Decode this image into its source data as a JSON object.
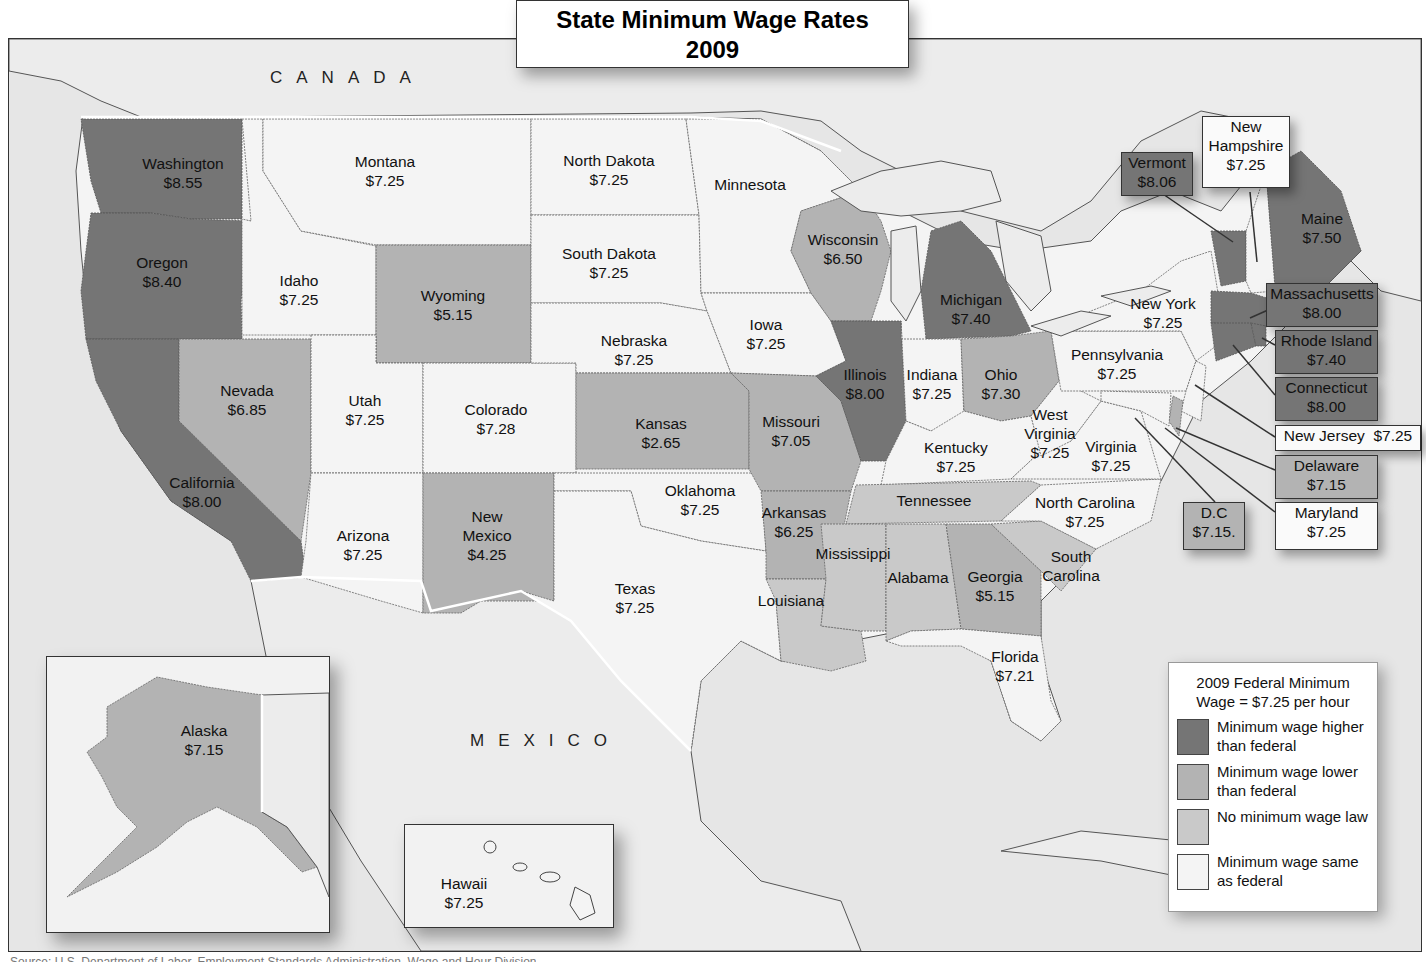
{
  "title": {
    "line1": "State Minimum Wage Rates",
    "line2": "2009"
  },
  "countries": {
    "canada": "CANADA",
    "mexico": "MEXICO"
  },
  "legend": {
    "title": "2009 Federal Minimum Wage = $7.25  per hour",
    "items": [
      {
        "category": "higher",
        "label": "Minimum wage higher than federal",
        "color": "#757575"
      },
      {
        "category": "lower",
        "label": "Minimum wage lower than federal",
        "color": "#b3b3b3"
      },
      {
        "category": "none",
        "label": "No minimum wage law",
        "color": "#c9c9c9"
      },
      {
        "category": "same",
        "label": "Minimum wage same as federal",
        "color": "#f4f4f4"
      }
    ]
  },
  "federal_minimum_wage": "$7.25",
  "states": {
    "washington": {
      "name": "Washington",
      "wage": "$8.55",
      "category": "higher"
    },
    "oregon": {
      "name": "Oregon",
      "wage": "$8.40",
      "category": "higher"
    },
    "california": {
      "name": "California",
      "wage": "$8.00",
      "category": "higher"
    },
    "nevada": {
      "name": "Nevada",
      "wage": "$6.85",
      "category": "lower"
    },
    "idaho": {
      "name": "Idaho",
      "wage": "$7.25",
      "category": "same"
    },
    "montana": {
      "name": "Montana",
      "wage": "$7.25",
      "category": "same"
    },
    "wyoming": {
      "name": "Wyoming",
      "wage": "$5.15",
      "category": "lower"
    },
    "utah": {
      "name": "Utah",
      "wage": "$7.25",
      "category": "same"
    },
    "colorado": {
      "name": "Colorado",
      "wage": "$7.28",
      "category": "same"
    },
    "arizona": {
      "name": "Arizona",
      "wage": "$7.25",
      "category": "same"
    },
    "new_mexico": {
      "name": "New Mexico",
      "name_l1": "New",
      "name_l2": "Mexico",
      "wage": "$4.25",
      "category": "lower"
    },
    "north_dakota": {
      "name": "North Dakota",
      "wage": "$7.25",
      "category": "same"
    },
    "south_dakota": {
      "name": "South Dakota",
      "wage": "$7.25",
      "category": "same"
    },
    "nebraska": {
      "name": "Nebraska",
      "wage": "$7.25",
      "category": "same"
    },
    "kansas": {
      "name": "Kansas",
      "wage": "$2.65",
      "category": "lower"
    },
    "oklahoma": {
      "name": "Oklahoma",
      "wage": "$7.25",
      "category": "same"
    },
    "texas": {
      "name": "Texas",
      "wage": "$7.25",
      "category": "same"
    },
    "minnesota": {
      "name": "Minnesota",
      "wage": "",
      "category": "same"
    },
    "iowa": {
      "name": "Iowa",
      "wage": "$7.25",
      "category": "same"
    },
    "missouri": {
      "name": "Missouri",
      "wage": "$7.05",
      "category": "lower"
    },
    "arkansas": {
      "name": "Arkansas",
      "wage": "$6.25",
      "category": "lower"
    },
    "louisiana": {
      "name": "Louisiana",
      "wage": "",
      "category": "none"
    },
    "wisconsin": {
      "name": "Wisconsin",
      "wage": "$6.50",
      "category": "lower"
    },
    "illinois": {
      "name": "Illinois",
      "wage": "$8.00",
      "category": "higher"
    },
    "michigan": {
      "name": "Michigan",
      "wage": "$7.40",
      "category": "higher"
    },
    "indiana": {
      "name": "Indiana",
      "wage": "$7.25",
      "category": "same"
    },
    "ohio": {
      "name": "Ohio",
      "wage": "$7.30",
      "category": "lower"
    },
    "kentucky": {
      "name": "Kentucky",
      "wage": "$7.25",
      "category": "same"
    },
    "tennessee": {
      "name": "Tennessee",
      "wage": "",
      "category": "none"
    },
    "mississippi": {
      "name": "Mississippi",
      "wage": "",
      "category": "none"
    },
    "alabama": {
      "name": "Alabama",
      "wage": "",
      "category": "none"
    },
    "georgia": {
      "name": "Georgia",
      "wage": "$5.15",
      "category": "lower"
    },
    "florida": {
      "name": "Florida",
      "wage": "$7.21",
      "category": "same"
    },
    "south_carolina": {
      "name": "South Carolina",
      "name_l1": "South",
      "name_l2": "Carolina",
      "wage": "",
      "category": "none"
    },
    "north_carolina": {
      "name": "North Carolina",
      "wage": "$7.25",
      "category": "same"
    },
    "virginia": {
      "name": "Virginia",
      "wage": "$7.25",
      "category": "same"
    },
    "west_virginia": {
      "name": "West Virginia",
      "name_l1": "West",
      "name_l2": "Virginia",
      "wage": "$7.25",
      "category": "same"
    },
    "pennsylvania": {
      "name": "Pennsylvania",
      "wage": "$7.25",
      "category": "same"
    },
    "new_york": {
      "name": "New York",
      "wage": "$7.25",
      "category": "same"
    },
    "vermont": {
      "name": "Vermont",
      "wage": "$8.06",
      "category": "higher"
    },
    "new_hampshire": {
      "name": "New Hampshire",
      "name_l1": "New",
      "name_l2": "Hampshire",
      "wage": "$7.25",
      "category": "same"
    },
    "maine": {
      "name": "Maine",
      "wage": "$7.50",
      "category": "higher"
    },
    "massachusetts": {
      "name": "Massachusetts",
      "wage": "$8.00",
      "category": "higher"
    },
    "rhode_island": {
      "name": "Rhode Island",
      "wage": "$7.40",
      "category": "higher"
    },
    "connecticut": {
      "name": "Connecticut",
      "wage": "$8.00",
      "category": "higher"
    },
    "new_jersey": {
      "name": "New Jersey",
      "wage": "$7.25",
      "category": "same"
    },
    "delaware": {
      "name": "Delaware",
      "wage": "$7.15",
      "category": "lower"
    },
    "maryland": {
      "name": "Maryland",
      "wage": "$7.25",
      "category": "same"
    },
    "dc": {
      "name": "D.C",
      "wage": "$7.15.",
      "category": "lower"
    },
    "alaska": {
      "name": "Alaska",
      "wage": "$7.15",
      "category": "lower"
    },
    "hawaii": {
      "name": "Hawaii",
      "wage": "$7.25",
      "category": "same"
    }
  },
  "source": "Source: U.S. Department of Labor, Employment Standards Administration, Wage and Hour Division"
}
